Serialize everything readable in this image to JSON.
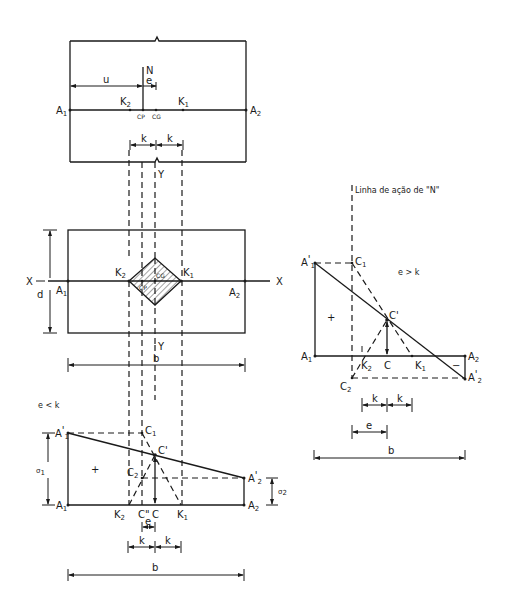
{
  "labels": {
    "A1": "A",
    "A2": "A",
    "sub1": "1",
    "sub2": "2",
    "prime": "'",
    "N": "N",
    "u": "u",
    "e": "e",
    "k": "k",
    "K": "K",
    "CP": "CP",
    "CG": "CG",
    "X": "X",
    "Y": "Y",
    "d": "d",
    "b": "b",
    "C": "C",
    "C_dblprime": "C\"",
    "C_prime": "C'",
    "sigma": "σ",
    "plus": "+",
    "minus": "−"
  },
  "captions": {
    "case_e_less_k": "e < k",
    "case_e_greater_k": "e > k",
    "line_of_action": "Linha de ação de \"N\""
  },
  "colors": {
    "ink": "#1a1a1a",
    "background": "#ffffff"
  }
}
